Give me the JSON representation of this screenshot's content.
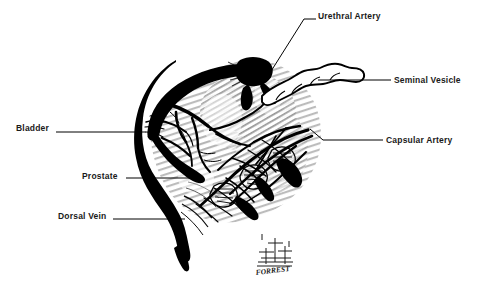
{
  "figure": {
    "style": "pen-and-ink black and white medical illustration",
    "background_color": "#ffffff",
    "ink_color": "#000000",
    "shading_color": "#9a9a9a",
    "width": 477,
    "height": 288
  },
  "labels": {
    "urethral_artery": "Urethral Artery",
    "seminal_vesicle": "Seminal Vesicle",
    "capsular_artery": "Capsular Artery",
    "bladder": "Bladder",
    "prostate": "Prostate",
    "dorsal_vein": "Dorsal Vein"
  },
  "signature": {
    "name": "FORREST"
  }
}
